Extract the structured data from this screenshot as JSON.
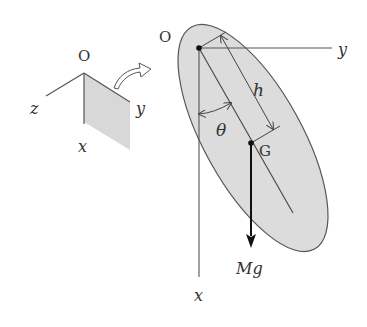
{
  "diagram": {
    "type": "rigid-body-pendulum",
    "colors": {
      "line": "#555555",
      "fill": "#dcdcdc",
      "text": "#333333",
      "arrow": "#111111"
    },
    "inset": {
      "origin_label": "O",
      "axis_x_label": "x",
      "axis_y_label": "y",
      "axis_z_label": "z"
    },
    "main": {
      "origin_label": "O",
      "axis_x_label": "x",
      "axis_y_label": "y",
      "center_of_mass_label": "G",
      "distance_label": "h",
      "angle_label": "θ",
      "force_label": "Mg"
    }
  }
}
